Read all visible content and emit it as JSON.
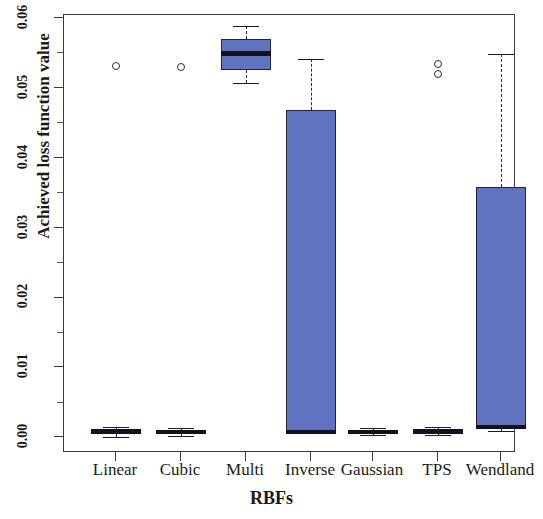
{
  "chart_data": {
    "type": "box",
    "title": "",
    "xlabel": "RBFs",
    "ylabel": "Achieved loss function value",
    "ylim": [
      0.0,
      0.06
    ],
    "yticks": [
      "0.00",
      "0.01",
      "0.02",
      "0.03",
      "0.04",
      "0.05",
      "0.06"
    ],
    "ytick_values": [
      0.0,
      0.01,
      0.02,
      0.03,
      0.04,
      0.05,
      0.06
    ],
    "grid": false,
    "legend": null,
    "categories": [
      "Linear",
      "Cubic",
      "Multi",
      "Inverse",
      "Gaussian",
      "TPS",
      "Wendland"
    ],
    "boxes": [
      {
        "category": "Linear",
        "whisker_low": 0.0002,
        "q1": 0.0006,
        "median": 0.001,
        "q3": 0.0013,
        "whisker_high": 0.0016,
        "outliers": [
          0.0533
        ]
      },
      {
        "category": "Cubic",
        "whisker_low": 0.0003,
        "q1": 0.0006,
        "median": 0.0009,
        "q3": 0.0012,
        "whisker_high": 0.0015,
        "outliers": [
          0.0531
        ]
      },
      {
        "category": "Multi",
        "whisker_low": 0.0508,
        "q1": 0.0527,
        "median": 0.0551,
        "q3": 0.0572,
        "whisker_high": 0.059,
        "outliers": []
      },
      {
        "category": "Inverse",
        "whisker_low": 0.0007,
        "q1": 0.0008,
        "median": 0.0009,
        "q3": 0.047,
        "whisker_high": 0.0543,
        "outliers": []
      },
      {
        "category": "Gaussian",
        "whisker_low": 0.0004,
        "q1": 0.0006,
        "median": 0.0009,
        "q3": 0.0012,
        "whisker_high": 0.0014,
        "outliers": []
      },
      {
        "category": "TPS",
        "whisker_low": 0.0004,
        "q1": 0.0007,
        "median": 0.001,
        "q3": 0.0013,
        "whisker_high": 0.0016,
        "outliers": [
          0.0536,
          0.0521
        ]
      },
      {
        "category": "Wendland",
        "whisker_low": 0.001,
        "q1": 0.0013,
        "median": 0.0016,
        "q3": 0.036,
        "whisker_high": 0.055,
        "outliers": []
      }
    ],
    "colors": {
      "box_fill": "#6073c0",
      "box_edge": "#22223a",
      "median": "#111122",
      "whisker": "#2a2a2a",
      "outlier_edge": "#2a2a2a",
      "axis": "#3a3a3a",
      "background": "#ffffff"
    }
  }
}
